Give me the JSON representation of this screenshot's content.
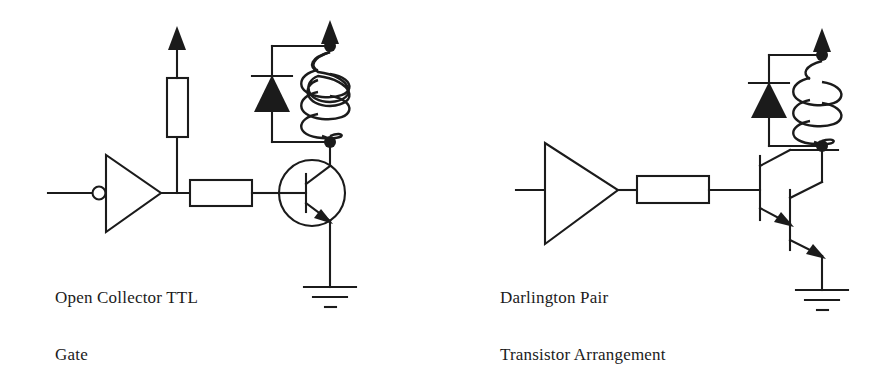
{
  "figure": {
    "type": "schematic-diagram",
    "background_color": "#ffffff",
    "ink_color": "#1b1b1b",
    "width": 875,
    "height": 332
  },
  "circuits": [
    {
      "id": "open-collector",
      "caption_lines": [
        "Open Collector TTL",
        "Gate"
      ],
      "components": [
        {
          "name": "input-terminal",
          "label": ""
        },
        {
          "name": "inverting-buffer-gate",
          "label": ""
        },
        {
          "name": "pull-up-resistor",
          "label": ""
        },
        {
          "name": "supply-arrow",
          "label": ""
        },
        {
          "name": "base-resistor",
          "label": ""
        },
        {
          "name": "npn-transistor",
          "label": ""
        },
        {
          "name": "flyback-diode",
          "label": ""
        },
        {
          "name": "inductor-coil",
          "label": ""
        },
        {
          "name": "ground-symbol",
          "label": ""
        }
      ]
    },
    {
      "id": "darlington-pair",
      "caption_lines": [
        "Darlington Pair",
        "Transistor Arrangement"
      ],
      "components": [
        {
          "name": "input-terminal",
          "label": ""
        },
        {
          "name": "buffer-gate",
          "label": ""
        },
        {
          "name": "base-resistor",
          "label": ""
        },
        {
          "name": "npn-transistor-first",
          "label": ""
        },
        {
          "name": "npn-transistor-second",
          "label": ""
        },
        {
          "name": "supply-arrow",
          "label": ""
        },
        {
          "name": "flyback-diode",
          "label": ""
        },
        {
          "name": "inductor-coil",
          "label": ""
        },
        {
          "name": "ground-symbol",
          "label": ""
        }
      ]
    }
  ],
  "captions": {
    "left": {
      "line1": "Open Collector TTL",
      "line2": "Gate"
    },
    "right": {
      "line1": "Darlington Pair",
      "line2": "Transistor Arrangement"
    }
  }
}
